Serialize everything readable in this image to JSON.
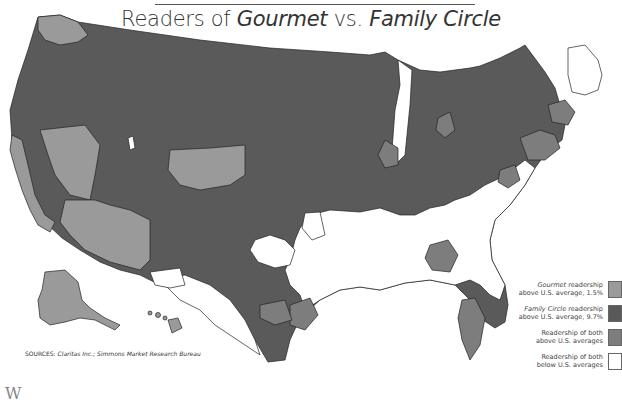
{
  "title": {
    "prefix": "Readers of ",
    "magazine1": "Gourmet",
    "middle": " vs. ",
    "magazine2": "Family Circle"
  },
  "legend": {
    "items": [
      {
        "line1_italic": "Gourmet",
        "line1_rest": " readership",
        "line2": "above U.S. average, 1.5%",
        "color": "#9a9a9a"
      },
      {
        "line1_italic": "Family Circle",
        "line1_rest": " readership",
        "line2": "above U.S. average, 9.7%",
        "color": "#5a5a5a"
      },
      {
        "line1_italic": "",
        "line1_rest": "Readership of both",
        "line2": "above U.S. averages",
        "color": "#7d7d7d"
      },
      {
        "line1_italic": "",
        "line1_rest": "Readership of both",
        "line2": "below U.S. averages",
        "color": "#ffffff"
      }
    ]
  },
  "sources": {
    "label": "SOURCES:",
    "text": "Claritas Inc.; Simmons Market Research Bureau"
  },
  "colors": {
    "gourmet": "#9a9a9a",
    "family_circle": "#5a5a5a",
    "both": "#7d7d7d",
    "neither": "#ffffff",
    "border": "#222222"
  },
  "bottom_fragment": "W"
}
